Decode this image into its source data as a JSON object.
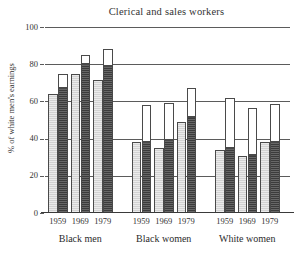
{
  "chart_data": {
    "type": "bar",
    "title": "Clerical and sales workers",
    "xlabel": "",
    "ylabel": "% of white men's earnings",
    "ylim": [
      0,
      100
    ],
    "yticks": [
      0,
      20,
      40,
      60,
      80,
      100
    ],
    "ytick_labels": [
      "0",
      "20",
      "40",
      "60",
      "80",
      "100"
    ],
    "grid": true,
    "legend": "none",
    "groups": [
      "Black men",
      "Black women",
      "White women"
    ],
    "categories": [
      "1959",
      "1969",
      "1979",
      "1959",
      "1969",
      "1979",
      "1959",
      "1969",
      "1979"
    ],
    "series": [
      {
        "name": "light-bar",
        "fill": "light-hatched",
        "values": [
          64,
          74.5,
          71.5,
          38,
          35,
          49,
          34,
          30.5,
          38
        ]
      },
      {
        "name": "dark-bar",
        "fill": "dark-hatched",
        "values": [
          67,
          80,
          79,
          38,
          39,
          51.5,
          35,
          31,
          38
        ]
      },
      {
        "name": "dark-bar-open-cap-top",
        "fill": "white-open",
        "values": [
          75,
          85,
          88,
          58,
          59,
          67,
          62,
          56.5,
          58.5
        ]
      }
    ],
    "bars": [
      {
        "group": "Black men",
        "year": "1959",
        "light": 64,
        "dark": 67,
        "cap_top": 75
      },
      {
        "group": "Black men",
        "year": "1969",
        "light": 74.5,
        "dark": 80,
        "cap_top": 85
      },
      {
        "group": "Black men",
        "year": "1979",
        "light": 71.5,
        "dark": 79,
        "cap_top": 88
      },
      {
        "group": "Black women",
        "year": "1959",
        "light": 38,
        "dark": 38,
        "cap_top": 58
      },
      {
        "group": "Black women",
        "year": "1969",
        "light": 35,
        "dark": 39,
        "cap_top": 59
      },
      {
        "group": "Black women",
        "year": "1979",
        "light": 49,
        "dark": 51.5,
        "cap_top": 67
      },
      {
        "group": "White women",
        "year": "1959",
        "light": 34,
        "dark": 35,
        "cap_top": 62
      },
      {
        "group": "White women",
        "year": "1969",
        "light": 30.5,
        "dark": 31,
        "cap_top": 56.5
      },
      {
        "group": "White women",
        "year": "1979",
        "light": 38,
        "dark": 38,
        "cap_top": 58.5
      }
    ],
    "colors": {
      "light_fill": "#d2d2d2",
      "dark_fill": "#3c3c3c",
      "cap_fill": "#ffffff",
      "outline": "#4a4a4a",
      "gridline": "#5b5b5b",
      "axis": "#3a3a3a",
      "text": "#2b2b2b",
      "background": "#ffffff"
    }
  }
}
